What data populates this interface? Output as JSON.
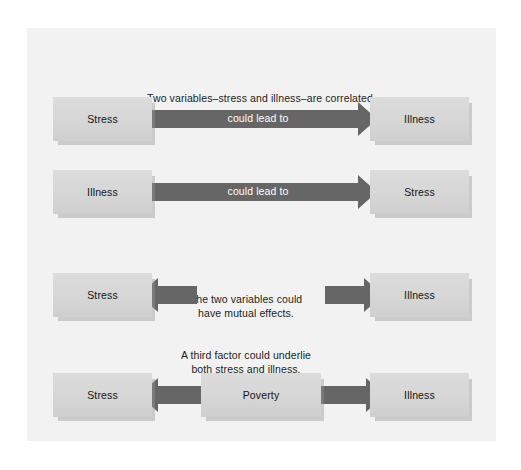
{
  "figure": {
    "background_color": "#ffffff",
    "panel_color": "#f2f2f2",
    "box_color": "#d6d6d6",
    "arrow_color": "#666666",
    "text_color": "#1c1c1c",
    "arrow_label_color": "#ffffff"
  },
  "captions": {
    "correlated": "Two variables–stress and illness–are correlated.",
    "mutual": "The two variables could\nhave mutual effects.",
    "third_factor": "A third factor could underlie\nboth stress and illness."
  },
  "rows": [
    {
      "id": "row-1",
      "left_box": "Stress",
      "right_box": "Illness",
      "arrow_label": "could lead to",
      "arrow_direction": "right"
    },
    {
      "id": "row-2",
      "left_box": "Illness",
      "right_box": "Stress",
      "arrow_label": "could lead to",
      "arrow_direction": "right"
    },
    {
      "id": "row-3",
      "left_box": "Stress",
      "right_box": "Illness",
      "arrow_label": "",
      "arrow_direction": "both-outward"
    },
    {
      "id": "row-4",
      "left_box": "Stress",
      "center_box": "Poverty",
      "right_box": "Illness",
      "arrow_label": "",
      "arrow_direction": "both-outward"
    }
  ]
}
